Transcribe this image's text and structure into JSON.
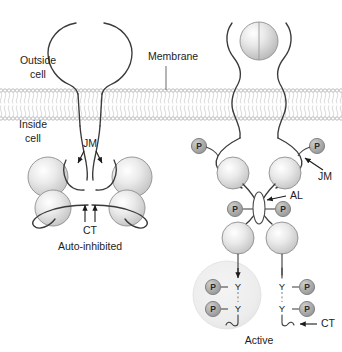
{
  "figure": {
    "background_color": "#ffffff",
    "line_color": "#3a3a3a",
    "sphere_color": "#d8d8d8",
    "phosphate_color": "#a8a8a8",
    "membrane_color": "#c6c6c6"
  },
  "labels": {
    "outside_cell": "Outside\ncell",
    "outside_cell_line1": "Outside",
    "outside_cell_line2": "cell",
    "inside_cell_line1": "Inside",
    "inside_cell_line2": "cell",
    "membrane": "Membrane",
    "jm_left": "JM",
    "jm_right": "JM",
    "ct_left": "CT",
    "ct_right": "CT",
    "al": "AL",
    "state_left": "Auto-inhibited",
    "state_right": "Active"
  },
  "phosphates": {
    "glyph": "P",
    "left_panel_count": 0,
    "right_panel": {
      "juxtamembrane": [
        "P",
        "P"
      ],
      "activation_loop": [
        "P",
        "P"
      ],
      "c_terminal_left": [
        "P",
        "P"
      ],
      "c_terminal_right": [
        "P",
        "P"
      ],
      "total": 8
    }
  },
  "tyrosines": {
    "glyph": "Y",
    "c_terminal_left": [
      "Y",
      "Y"
    ],
    "c_terminal_right": [
      "Y",
      "Y"
    ],
    "total": 4
  },
  "panels": [
    {
      "id": "auto-inhibited",
      "state_label": "Auto-inhibited",
      "ligand_bound": false,
      "ectodomain": "open-unliganded",
      "kinase_lobes_per_monomer": 2,
      "monomers": 2,
      "annotations": [
        "JM",
        "CT"
      ]
    },
    {
      "id": "active",
      "state_label": "Active",
      "ligand_bound": true,
      "ligand": "dimeric-ligand-sphere",
      "ectodomain": "closed-liganded-dimer",
      "kinase_lobes_per_monomer": 2,
      "monomers": 2,
      "annotations": [
        "JM",
        "AL",
        "CT"
      ],
      "docking_domain": "shaded-circle-left-ct"
    }
  ]
}
